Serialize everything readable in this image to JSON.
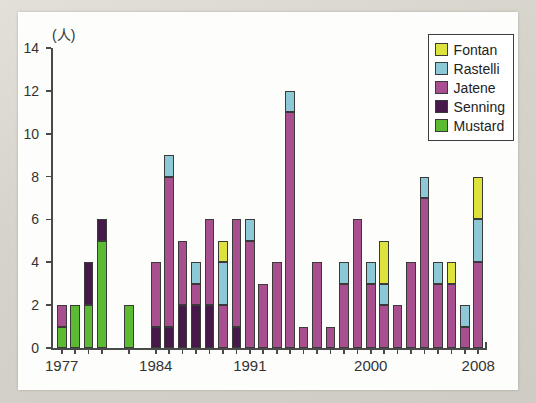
{
  "chart_data": {
    "type": "bar",
    "title": "",
    "subtitle": "",
    "xlabel": "",
    "ylabel": "(人)",
    "unit_label": "(人)",
    "stacked": true,
    "grid": false,
    "legend_position": "top-right",
    "ylim": [
      0,
      14
    ],
    "ytick_labels": [
      "0",
      "2",
      "4",
      "6",
      "8",
      "10",
      "12",
      "14"
    ],
    "yticks": [
      0,
      2,
      4,
      6,
      8,
      10,
      12,
      14
    ],
    "xtick_labels": [
      "1977",
      "1984",
      "1991",
      "2000",
      "2008"
    ],
    "xticks": [
      1977,
      1984,
      1991,
      2000,
      2008
    ],
    "categories": [
      "1977",
      "1978",
      "1979",
      "1980",
      "1981",
      "1982",
      "1983",
      "1984",
      "1985",
      "1986",
      "1987",
      "1988",
      "1989",
      "1990",
      "1991",
      "1992",
      "1993",
      "1994",
      "1995",
      "1996",
      "1997",
      "1998",
      "1999",
      "2000",
      "2001",
      "2002",
      "2003",
      "2004",
      "2005",
      "2006",
      "2007",
      "2008"
    ],
    "series": [
      {
        "name": "Mustard",
        "color": "#5dbb33",
        "values": [
          1,
          2,
          2,
          5,
          0,
          2,
          0,
          0,
          0,
          0,
          0,
          0,
          0,
          0,
          0,
          0,
          0,
          0,
          0,
          0,
          0,
          0,
          0,
          0,
          0,
          0,
          0,
          0,
          0,
          0,
          0,
          0
        ]
      },
      {
        "name": "Senning",
        "color": "#46194a",
        "values": [
          0,
          0,
          2,
          1,
          0,
          0,
          0,
          1,
          1,
          2,
          2,
          2,
          0,
          1,
          0,
          0,
          0,
          0,
          0,
          0,
          0,
          0,
          0,
          0,
          0,
          0,
          0,
          0,
          0,
          0,
          0,
          0
        ]
      },
      {
        "name": "Jatene",
        "color": "#a8508f",
        "values": [
          1,
          0,
          0,
          0,
          0,
          0,
          0,
          3,
          7,
          3,
          1,
          4,
          2,
          5,
          5,
          3,
          4,
          11,
          1,
          4,
          1,
          3,
          6,
          3,
          2,
          2,
          4,
          7,
          3,
          3,
          1,
          4
        ]
      },
      {
        "name": "Rastelli",
        "color": "#8cc8d6",
        "values": [
          0,
          0,
          0,
          0,
          0,
          0,
          0,
          0,
          1,
          0,
          1,
          0,
          2,
          0,
          1,
          0,
          0,
          1,
          0,
          0,
          0,
          1,
          0,
          1,
          1,
          0,
          0,
          1,
          1,
          0,
          1,
          2
        ]
      },
      {
        "name": "Fontan",
        "color": "#dde23c",
        "values": [
          0,
          0,
          0,
          0,
          0,
          0,
          0,
          0,
          0,
          0,
          0,
          0,
          1,
          0,
          0,
          0,
          0,
          0,
          0,
          0,
          0,
          0,
          0,
          0,
          2,
          0,
          0,
          0,
          0,
          1,
          0,
          2
        ]
      }
    ],
    "totals": [
      2,
      2,
      4,
      6,
      0,
      2,
      0,
      4,
      9,
      5,
      4,
      6,
      5,
      6,
      6,
      3,
      4,
      12,
      1,
      4,
      1,
      4,
      6,
      4,
      5,
      2,
      4,
      8,
      4,
      4,
      2,
      8
    ]
  },
  "legend": {
    "items": [
      {
        "label": "Fontan",
        "color": "#dde23c"
      },
      {
        "label": "Rastelli",
        "color": "#8cc8d6"
      },
      {
        "label": "Jatene",
        "color": "#a8508f"
      },
      {
        "label": "Senning",
        "color": "#46194a"
      },
      {
        "label": "Mustard",
        "color": "#5dbb33"
      }
    ]
  }
}
